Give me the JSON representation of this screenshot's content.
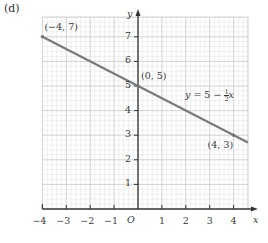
{
  "part_label": "(d)",
  "chart_data": {
    "type": "line",
    "title": "",
    "xlabel": "x",
    "ylabel": "y",
    "origin_label": "O",
    "xlim": [
      -4,
      4.6
    ],
    "ylim": [
      0,
      7.8
    ],
    "x_ticks": [
      -4,
      -3,
      -2,
      -1,
      1,
      2,
      3,
      4
    ],
    "x_tick_labels": [
      "−4",
      "−3",
      "−2",
      "−1",
      "1",
      "2",
      "3",
      "4"
    ],
    "y_ticks": [
      1,
      2,
      3,
      4,
      5,
      6,
      7
    ],
    "y_tick_labels": [
      "1",
      "2",
      "3",
      "4",
      "5",
      "6",
      "7"
    ],
    "grid": true,
    "minor_grid_per_unit": 5,
    "series": [
      {
        "name": "y = 5 − ½x",
        "equation_label": "y = 5 − ½x",
        "x": [
          -4,
          4.6
        ],
        "y": [
          7,
          2.7
        ],
        "color": "#7a7a7a"
      }
    ],
    "annotations": [
      {
        "text": "(−4, 7)",
        "x": -4,
        "y": 7
      },
      {
        "text": "(0, 5)",
        "x": 0,
        "y": 5
      },
      {
        "text": "(4, 3)",
        "x": 4,
        "y": 3
      }
    ],
    "colors": {
      "axis": "#333333",
      "line": "#7a7a7a",
      "grid_major": "#c8c8c8",
      "grid_minor": "#e6e6e6"
    }
  }
}
